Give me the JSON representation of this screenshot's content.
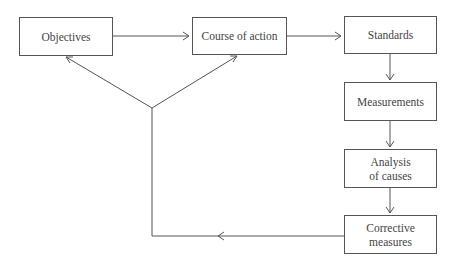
{
  "diagram": {
    "nodes": [
      {
        "id": "objectives",
        "label": "Objectives"
      },
      {
        "id": "course",
        "label": "Course of action"
      },
      {
        "id": "standards",
        "label": "Standards"
      },
      {
        "id": "measurements",
        "label": "Measurements"
      },
      {
        "id": "analysis",
        "label_line1": "Analysis",
        "label_line2": "of causes"
      },
      {
        "id": "corrective",
        "label_line1": "Corrective",
        "label_line2": "measures"
      }
    ],
    "edges": [
      {
        "from": "objectives",
        "to": "course"
      },
      {
        "from": "course",
        "to": "standards"
      },
      {
        "from": "standards",
        "to": "measurements"
      },
      {
        "from": "measurements",
        "to": "analysis"
      },
      {
        "from": "analysis",
        "to": "corrective"
      },
      {
        "from": "corrective",
        "to": "objectives",
        "via": "feedback-junction"
      },
      {
        "from": "corrective",
        "to": "course",
        "via": "feedback-junction"
      }
    ],
    "colors": {
      "line": "#555555",
      "text": "#444444",
      "background": "#ffffff"
    }
  }
}
